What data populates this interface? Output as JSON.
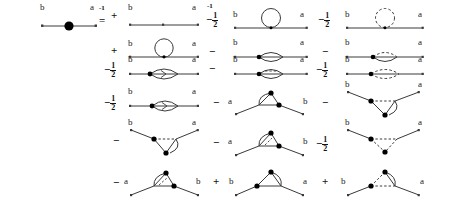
{
  "figure": {
    "kind": "feynman-diagram-equation",
    "stroke_color": "#3a3a3a",
    "vertex_color": "#000000",
    "label_a": "a",
    "label_b": "b"
  },
  "operators": {
    "inverse_exponent": "-1",
    "equals": "=",
    "plus": "+",
    "minus": "−",
    "half_num": "1",
    "half_den": "2"
  },
  "rows": [
    {
      "row": 1,
      "cells": [
        {
          "col": 1,
          "op": "",
          "sup": "-1",
          "diagram": "bare-propagator-blob",
          "left_label": "b",
          "right_label": "a"
        },
        {
          "col": 2,
          "op": "=",
          "sup": "",
          "diagram": "free-line-two-dots",
          "left_label": "b",
          "right_label": "a"
        },
        {
          "col": 3,
          "op": "−",
          "frac": "1/2",
          "sup": "-1",
          "diagram": "tadpole-circle-solid",
          "left_label": "b",
          "right_label": "a"
        },
        {
          "col": 4,
          "op": "−",
          "frac": "1/2",
          "diagram": "tadpole-circle-dashed",
          "left_label": "b",
          "right_label": "a"
        }
      ]
    },
    {
      "row": 2,
      "cells": [
        {
          "col": 2,
          "op": "+",
          "diagram": "sunset-circle-solid",
          "left_label": "b",
          "right_label": "a"
        },
        {
          "col": 3,
          "op": "−",
          "diagram": "lens-solid-left-vertex",
          "left_label": "b",
          "right_label": "a"
        },
        {
          "col": 4,
          "op": "−",
          "diagram": "lens-dashed-left-vertex",
          "left_label": "b",
          "right_label": "a"
        }
      ]
    },
    {
      "row": 3,
      "cells": [
        {
          "col": 2,
          "op": "−",
          "frac": "1/2",
          "diagram": "lens-solid-arrow",
          "left_label": "b",
          "right_label": "a"
        },
        {
          "col": 3,
          "op": "−",
          "diagram": "lens-dashed-inner",
          "left_label": "b",
          "right_label": "a"
        },
        {
          "col": 4,
          "op": "−",
          "frac": "1/2",
          "diagram": "lens-dashed-double",
          "left_label": "b",
          "right_label": "a"
        }
      ]
    },
    {
      "row": 4,
      "cells": [
        {
          "col": 2,
          "op": "−",
          "frac": "1/2",
          "diagram": "lens-solid-arrow-2",
          "left_label": "b",
          "right_label": "a"
        },
        {
          "col": 3,
          "op": "−",
          "diagram": "triangle-solid-loop",
          "left_label": "a",
          "right_label": "b"
        },
        {
          "col": 4,
          "op": "−",
          "diagram": "vee-solid-hook",
          "left_label": "b",
          "right_label": "a"
        }
      ]
    },
    {
      "row": 5,
      "cells": [
        {
          "col": 2,
          "op": "−",
          "diagram": "vee-dashed-hook",
          "left_label": "b",
          "right_label": "a"
        },
        {
          "col": 3,
          "op": "−",
          "diagram": "triangle-solid-slash",
          "left_label": "a",
          "right_label": "b"
        },
        {
          "col": 4,
          "op": "−",
          "frac": "1/2",
          "diagram": "vee-dashed-double",
          "left_label": "b",
          "right_label": "a"
        }
      ]
    },
    {
      "row": 6,
      "cells": [
        {
          "col": 2,
          "op": "−",
          "diagram": "triangle-dashed-slash",
          "left_label": "a",
          "right_label": "b"
        },
        {
          "col": 3,
          "op": "+",
          "diagram": "triangle-solid-box",
          "left_label": "b",
          "right_label": "a"
        },
        {
          "col": 4,
          "op": "+",
          "diagram": "triangle-dashed-box",
          "left_label": "b",
          "right_label": "a"
        }
      ]
    }
  ]
}
